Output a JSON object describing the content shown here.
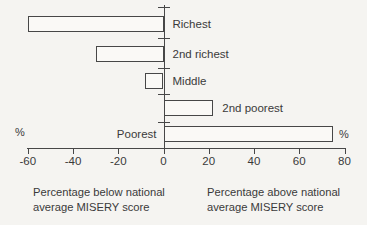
{
  "page": {
    "background_color": "#f5f4f1",
    "ink_color": "#474747"
  },
  "chart_data": {
    "type": "bar",
    "orientation": "horizontal",
    "title": "",
    "categories": [
      "Richest",
      "2nd richest",
      "Middle",
      "2nd poorest",
      "Poorest"
    ],
    "values": [
      -60,
      -30,
      -8,
      22,
      75
    ],
    "xlim": [
      -60,
      80
    ],
    "x_ticks": [
      -60,
      -40,
      -20,
      0,
      20,
      40,
      60,
      80
    ],
    "grid": false,
    "legend": "none",
    "bar_fill": "#faf9f6",
    "bar_outline": "#474747",
    "label_positions": [
      "axis-right",
      "axis-right",
      "axis-right",
      "bar-right",
      "axis-left"
    ],
    "unit_label_left": "%",
    "unit_label_right": "%"
  },
  "captions": {
    "left": {
      "line1": "Percentage below national",
      "line2": "average MISERY score"
    },
    "right": {
      "line1": "Percentage above national",
      "line2": "average MISERY score"
    }
  }
}
